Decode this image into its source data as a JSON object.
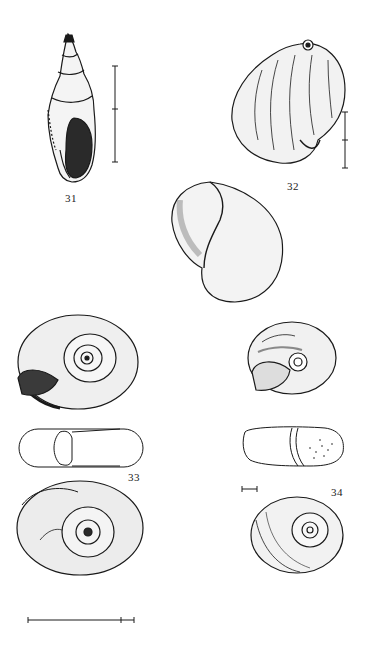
{
  "plate": {
    "background": "#ffffff",
    "ink": "#1a1a1a",
    "figures": [
      {
        "id": "31",
        "label": "31",
        "description": "high-spired shell, apertural view",
        "scale_bar": "vertical, two segments"
      },
      {
        "id": "32",
        "label": "32",
        "description": "globose shell, dorsal and apertural views",
        "scale_bar": "vertical, two segments"
      },
      {
        "id": "33",
        "label": "33",
        "description": "planispiral shell: apical, apertural (side) and umbilical views",
        "scale_bar": "horizontal, long"
      },
      {
        "id": "34",
        "label": "34",
        "description": "small depressed shell: umbilical, side and apical views",
        "scale_bar": "horizontal, short"
      }
    ]
  }
}
